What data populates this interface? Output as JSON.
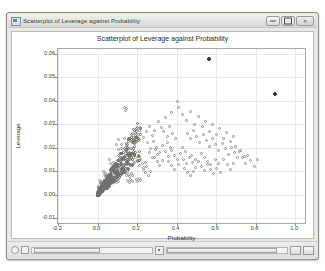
{
  "window": {
    "title": "Scatterplot of Leverage against Probability",
    "icon": "chart-window-icon",
    "controls": {
      "minimize_label": "—",
      "maximize_label": "□",
      "close_label": "✕"
    }
  },
  "statusbar": {
    "left_icon": "circle-handle-icon",
    "left_icon2": "square-handle-icon",
    "slider_marker": "slider-marker-icon",
    "end_button1": "scroll-left-icon",
    "end_button2": "scroll-right-icon"
  },
  "chart_data": {
    "type": "scatter",
    "title": "Scatterplot of Leverage against Probability",
    "xlabel": "Probability",
    "ylabel": "Leverage",
    "xlim": [
      -0.2,
      1.05
    ],
    "ylim": [
      -0.012,
      0.062
    ],
    "xticks": [
      -0.2,
      0.0,
      0.2,
      0.4,
      0.6,
      0.8,
      1.0
    ],
    "xticklabels": [
      "-0.2",
      "0.0",
      "0.2",
      "0.4",
      "0.6",
      "0.8",
      "1.0"
    ],
    "yticks": [
      -0.01,
      0.0,
      0.01,
      0.02,
      0.03,
      0.04,
      0.05,
      0.06
    ],
    "yticklabels": [
      "-0.01",
      "0.00",
      "0.01",
      "0.02",
      "0.03",
      "0.04",
      "0.05",
      "0.06"
    ],
    "grid": true,
    "legend": null,
    "marker": "open-circle",
    "series": [
      {
        "name": "observations",
        "marker": "open-circle",
        "points": [
          [
            0.135,
            0.037
          ],
          [
            0.148,
            0.0365
          ],
          [
            0.142,
            0.0358
          ],
          [
            0.404,
            0.0395
          ],
          [
            0.408,
            0.0372
          ],
          [
            0.372,
            0.0352
          ],
          [
            0.345,
            0.033
          ],
          [
            0.43,
            0.0342
          ],
          [
            0.452,
            0.0318
          ],
          [
            0.47,
            0.0355
          ],
          [
            0.492,
            0.03
          ],
          [
            0.512,
            0.0332
          ],
          [
            0.53,
            0.0292
          ],
          [
            0.548,
            0.0312
          ],
          [
            0.566,
            0.0268
          ],
          [
            0.583,
            0.03
          ],
          [
            0.6,
            0.0255
          ],
          [
            0.618,
            0.0282
          ],
          [
            0.636,
            0.024
          ],
          [
            0.654,
            0.0265
          ],
          [
            0.672,
            0.0228
          ],
          [
            0.69,
            0.025
          ],
          [
            0.308,
            0.0312
          ],
          [
            0.322,
            0.0288
          ],
          [
            0.336,
            0.0268
          ],
          [
            0.352,
            0.0248
          ],
          [
            0.366,
            0.0292
          ],
          [
            0.38,
            0.0262
          ],
          [
            0.394,
            0.0238
          ],
          [
            0.29,
            0.0272
          ],
          [
            0.276,
            0.0252
          ],
          [
            0.262,
            0.0292
          ],
          [
            0.248,
            0.0268
          ],
          [
            0.234,
            0.0242
          ],
          [
            0.22,
            0.0285
          ],
          [
            0.206,
            0.0258
          ],
          [
            0.192,
            0.0232
          ],
          [
            0.178,
            0.0262
          ],
          [
            0.164,
            0.0238
          ],
          [
            0.15,
            0.0215
          ],
          [
            0.136,
            0.024
          ],
          [
            0.122,
            0.0212
          ],
          [
            0.108,
            0.0235
          ],
          [
            0.455,
            0.0262
          ],
          [
            0.47,
            0.0238
          ],
          [
            0.486,
            0.0275
          ],
          [
            0.502,
            0.0248
          ],
          [
            0.518,
            0.0222
          ],
          [
            0.534,
            0.0258
          ],
          [
            0.55,
            0.023
          ],
          [
            0.566,
            0.0205
          ],
          [
            0.582,
            0.0238
          ],
          [
            0.598,
            0.0212
          ],
          [
            0.614,
            0.0188
          ],
          [
            0.63,
            0.022
          ],
          [
            0.646,
            0.0195
          ],
          [
            0.662,
            0.0172
          ],
          [
            0.678,
            0.0202
          ],
          [
            0.694,
            0.0178
          ],
          [
            0.71,
            0.0158
          ],
          [
            0.726,
            0.0188
          ],
          [
            0.742,
            0.0162
          ],
          [
            0.255,
            0.0222
          ],
          [
            0.27,
            0.0198
          ],
          [
            0.285,
            0.0225
          ],
          [
            0.3,
            0.0202
          ],
          [
            0.315,
            0.018
          ],
          [
            0.33,
            0.0208
          ],
          [
            0.345,
            0.0185
          ],
          [
            0.36,
            0.0162
          ],
          [
            0.375,
            0.019
          ],
          [
            0.39,
            0.0168
          ],
          [
            0.405,
            0.0148
          ],
          [
            0.42,
            0.0175
          ],
          [
            0.435,
            0.0152
          ],
          [
            0.45,
            0.0132
          ],
          [
            0.465,
            0.0158
          ],
          [
            0.48,
            0.0138
          ],
          [
            0.495,
            0.0118
          ],
          [
            0.51,
            0.0142
          ],
          [
            0.525,
            0.0122
          ],
          [
            0.54,
            0.0105
          ],
          [
            0.555,
            0.0128
          ],
          [
            0.098,
            0.0212
          ],
          [
            0.106,
            0.0192
          ],
          [
            0.114,
            0.0175
          ],
          [
            0.122,
            0.0198
          ],
          [
            0.13,
            0.0178
          ],
          [
            0.138,
            0.016
          ],
          [
            0.146,
            0.0182
          ],
          [
            0.154,
            0.0165
          ],
          [
            0.162,
            0.0148
          ],
          [
            0.17,
            0.017
          ],
          [
            0.178,
            0.0152
          ],
          [
            0.186,
            0.0136
          ],
          [
            0.194,
            0.0158
          ],
          [
            0.202,
            0.0142
          ],
          [
            0.21,
            0.0126
          ],
          [
            0.218,
            0.0148
          ],
          [
            0.226,
            0.0132
          ],
          [
            0.234,
            0.0118
          ],
          [
            0.242,
            0.0138
          ],
          [
            0.25,
            0.0122
          ],
          [
            0.062,
            0.0148
          ],
          [
            0.068,
            0.0132
          ],
          [
            0.074,
            0.0118
          ],
          [
            0.08,
            0.0138
          ],
          [
            0.086,
            0.0122
          ],
          [
            0.092,
            0.0108
          ],
          [
            0.098,
            0.0128
          ],
          [
            0.104,
            0.0112
          ],
          [
            0.11,
            0.0098
          ],
          [
            0.116,
            0.0118
          ],
          [
            0.122,
            0.0102
          ],
          [
            0.128,
            0.009
          ],
          [
            0.134,
            0.0108
          ],
          [
            0.14,
            0.0094
          ],
          [
            0.146,
            0.0082
          ],
          [
            0.152,
            0.01
          ],
          [
            0.158,
            0.0086
          ],
          [
            0.164,
            0.0076
          ],
          [
            0.17,
            0.0092
          ],
          [
            0.176,
            0.008
          ],
          [
            0.03,
            0.0098
          ],
          [
            0.034,
            0.0088
          ],
          [
            0.038,
            0.0078
          ],
          [
            0.042,
            0.0092
          ],
          [
            0.046,
            0.0082
          ],
          [
            0.05,
            0.0072
          ],
          [
            0.054,
            0.0086
          ],
          [
            0.058,
            0.0076
          ],
          [
            0.062,
            0.0066
          ],
          [
            0.066,
            0.008
          ],
          [
            0.07,
            0.007
          ],
          [
            0.074,
            0.0062
          ],
          [
            0.078,
            0.0074
          ],
          [
            0.082,
            0.0064
          ],
          [
            0.086,
            0.0056
          ],
          [
            0.09,
            0.0068
          ],
          [
            0.094,
            0.006
          ],
          [
            0.098,
            0.0052
          ],
          [
            0.102,
            0.0064
          ],
          [
            0.106,
            0.0056
          ],
          [
            0.012,
            0.006
          ],
          [
            0.014,
            0.0054
          ],
          [
            0.016,
            0.0048
          ],
          [
            0.018,
            0.0058
          ],
          [
            0.02,
            0.005
          ],
          [
            0.022,
            0.0044
          ],
          [
            0.024,
            0.0054
          ],
          [
            0.026,
            0.0046
          ],
          [
            0.028,
            0.004
          ],
          [
            0.03,
            0.005
          ],
          [
            0.032,
            0.0042
          ],
          [
            0.034,
            0.0036
          ],
          [
            0.036,
            0.0046
          ],
          [
            0.038,
            0.0038
          ],
          [
            0.04,
            0.0032
          ],
          [
            0.042,
            0.0042
          ],
          [
            0.044,
            0.0034
          ],
          [
            0.046,
            0.0028
          ],
          [
            0.048,
            0.0038
          ],
          [
            0.05,
            0.003
          ],
          [
            0.004,
            0.0034
          ],
          [
            0.005,
            0.003
          ],
          [
            0.006,
            0.0026
          ],
          [
            0.007,
            0.0032
          ],
          [
            0.008,
            0.0028
          ],
          [
            0.009,
            0.0024
          ],
          [
            0.01,
            0.003
          ],
          [
            0.011,
            0.0026
          ],
          [
            0.012,
            0.0022
          ],
          [
            0.013,
            0.0028
          ],
          [
            0.014,
            0.0024
          ],
          [
            0.015,
            0.002
          ],
          [
            0.016,
            0.0026
          ],
          [
            0.017,
            0.0022
          ],
          [
            0.018,
            0.0018
          ],
          [
            0.019,
            0.0024
          ],
          [
            0.02,
            0.002
          ],
          [
            0.021,
            0.0016
          ],
          [
            0.022,
            0.0022
          ],
          [
            0.023,
            0.0018
          ],
          [
            0.76,
            0.0168
          ],
          [
            0.776,
            0.0145
          ],
          [
            0.792,
            0.0122
          ],
          [
            0.808,
            0.015
          ],
          [
            0.7,
            0.0205
          ],
          [
            0.716,
            0.0182
          ],
          [
            0.732,
            0.0158
          ],
          [
            0.748,
            0.0135
          ],
          [
            0.64,
            0.0148
          ],
          [
            0.656,
            0.0128
          ],
          [
            0.672,
            0.0108
          ],
          [
            0.688,
            0.0132
          ],
          [
            0.572,
            0.0108
          ],
          [
            0.588,
            0.0092
          ],
          [
            0.604,
            0.0112
          ],
          [
            0.62,
            0.0096
          ],
          [
            0.44,
            0.0112
          ],
          [
            0.456,
            0.0096
          ],
          [
            0.472,
            0.0082
          ],
          [
            0.488,
            0.01
          ],
          [
            0.36,
            0.0142
          ],
          [
            0.376,
            0.0124
          ],
          [
            0.392,
            0.0108
          ],
          [
            0.408,
            0.0128
          ],
          [
            0.288,
            0.0158
          ],
          [
            0.302,
            0.014
          ],
          [
            0.316,
            0.0124
          ],
          [
            0.33,
            0.0144
          ],
          [
            0.232,
            0.0108
          ],
          [
            0.244,
            0.0094
          ],
          [
            0.256,
            0.0082
          ],
          [
            0.268,
            0.0098
          ],
          [
            0.196,
            0.0066
          ],
          [
            0.204,
            0.0058
          ],
          [
            0.212,
            0.007
          ],
          [
            0.22,
            0.006
          ],
          [
            0.152,
            0.0062
          ],
          [
            0.16,
            0.0054
          ],
          [
            0.168,
            0.0066
          ],
          [
            0.176,
            0.0058
          ],
          [
            0.428,
            0.0202
          ],
          [
            0.444,
            0.0182
          ],
          [
            0.352,
            0.0222
          ],
          [
            0.368,
            0.02
          ],
          [
            0.478,
            0.0168
          ],
          [
            0.494,
            0.015
          ],
          [
            0.524,
            0.0176
          ],
          [
            0.54,
            0.0158
          ],
          [
            0.596,
            0.0152
          ],
          [
            0.612,
            0.0135
          ],
          [
            0.556,
            0.0142
          ],
          [
            0.572,
            0.0128
          ],
          [
            0.264,
            0.0178
          ],
          [
            0.278,
            0.016
          ],
          [
            0.292,
            0.0192
          ],
          [
            0.306,
            0.0172
          ]
        ]
      },
      {
        "name": "high-leverage outliers",
        "marker": "filled-circle",
        "points": [
          [
            0.562,
            0.0578
          ],
          [
            0.9,
            0.0428
          ]
        ]
      }
    ]
  }
}
